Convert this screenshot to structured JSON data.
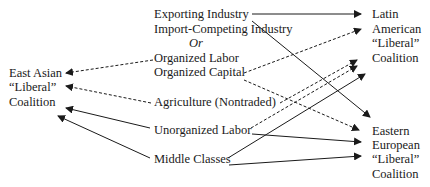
{
  "diagram": {
    "center_groups": [
      {
        "id": "exporting",
        "label": "Exporting Industry"
      },
      {
        "id": "import_competing",
        "label": "Import-Competing Industry"
      },
      {
        "id": "or",
        "label": "Or"
      },
      {
        "id": "organized_labor",
        "label": "Organized Labor"
      },
      {
        "id": "organized_capital",
        "label": "Organized Capital"
      },
      {
        "id": "agriculture",
        "label": "Agriculture (Nontraded)"
      },
      {
        "id": "unorganized_labor",
        "label": "Unorganized Labor"
      },
      {
        "id": "middle_classes",
        "label": "Middle Classes"
      }
    ],
    "coalitions": {
      "east_asian": [
        "East Asian",
        "“Liberal”",
        "Coalition"
      ],
      "latin_american": [
        "Latin",
        "American",
        "“Liberal”",
        "Coalition"
      ],
      "eastern_european": [
        "Eastern",
        "European",
        "“Liberal”",
        "Coalition"
      ]
    },
    "edges": [
      {
        "from": "organized_labor",
        "to": "east_asian",
        "style": "dashed"
      },
      {
        "from": "agriculture",
        "to": "east_asian",
        "style": "dashed"
      },
      {
        "from": "unorganized_labor",
        "to": "east_asian",
        "style": "solid"
      },
      {
        "from": "middle_classes",
        "to": "east_asian",
        "style": "solid"
      },
      {
        "from": "exporting",
        "to": "latin_american",
        "style": "solid"
      },
      {
        "from": "exporting",
        "to": "eastern_european",
        "style": "solid"
      },
      {
        "from": "organized_capital",
        "to": "latin_american",
        "style": "dashed"
      },
      {
        "from": "organized_capital",
        "to": "eastern_european",
        "style": "dashed"
      },
      {
        "from": "agriculture",
        "to": "latin_american",
        "style": "dashed"
      },
      {
        "from": "unorganized_labor",
        "to": "latin_american",
        "style": "dashed"
      },
      {
        "from": "middle_classes",
        "to": "latin_american",
        "style": "solid"
      },
      {
        "from": "unorganized_labor",
        "to": "eastern_european",
        "style": "solid"
      },
      {
        "from": "middle_classes",
        "to": "eastern_european",
        "style": "solid"
      }
    ],
    "colors": {
      "ink": "#1a1a1a",
      "background": "#ffffff"
    }
  }
}
